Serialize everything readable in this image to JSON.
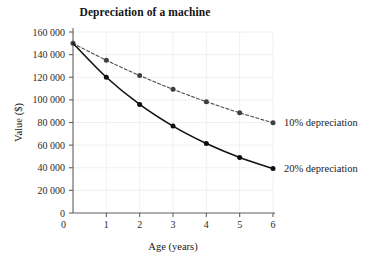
{
  "chart_data": {
    "type": "line",
    "title": "Depreciation of a machine",
    "xlabel": "Age (years)",
    "ylabel": "Value ($)",
    "xlim": [
      0,
      6
    ],
    "ylim": [
      0,
      160000
    ],
    "grid": true,
    "legend_position": "inline-right",
    "x": [
      0,
      1,
      2,
      3,
      4,
      5,
      6
    ],
    "x_tick_labels": [
      "0",
      "1",
      "2",
      "3",
      "4",
      "5",
      "6"
    ],
    "y_ticks": [
      0,
      20000,
      40000,
      60000,
      80000,
      100000,
      120000,
      140000,
      160000
    ],
    "y_tick_labels": [
      "0",
      "20 000",
      "40 000",
      "60 000",
      "80 000",
      "100 000",
      "120 000",
      "140 000",
      "160 000"
    ],
    "series": [
      {
        "name": "10% depreciation",
        "label": "10% depreciation",
        "style": "dashed",
        "color": "#4d4d4d",
        "marker": "circle",
        "values": [
          150000,
          135000,
          121500,
          109350,
          98415,
          88574,
          79716
        ]
      },
      {
        "name": "20% depreciation",
        "label": "20% depreciation",
        "style": "solid",
        "color": "#121212",
        "marker": "circle",
        "values": [
          150000,
          120000,
          96000,
          76800,
          61440,
          49152,
          39322
        ]
      }
    ]
  },
  "colors": {
    "background": "#ffffff",
    "axis": "#5f5f5f",
    "grid": "#ececed",
    "text": "#1a1a1a",
    "series_10": "#4d4d4d",
    "series_20": "#121212"
  }
}
